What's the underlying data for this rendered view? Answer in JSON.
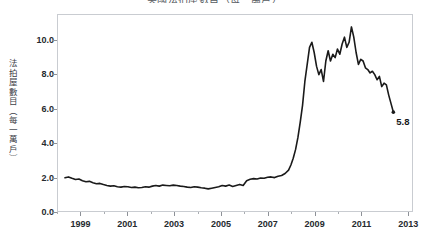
{
  "chart": {
    "title": "美國法拍屋數目（每一萬戶）",
    "ylabel": "法拍屋數目（每一萬戶）",
    "end_annotation": "5.8"
  },
  "chart_data": {
    "type": "line",
    "title": "美國法拍屋數目（每一萬戶）",
    "xlabel": "",
    "ylabel": "法拍屋數目（每一萬戶）",
    "xlim": [
      1998.0,
      2013.2
    ],
    "ylim": [
      0.0,
      11.5
    ],
    "xticks": [
      1999,
      2001,
      2003,
      2005,
      2007,
      2009,
      2011,
      2013
    ],
    "xtick_labels": [
      "1999",
      "2001",
      "2003",
      "2005",
      "2007",
      "2009",
      "2011",
      "2013"
    ],
    "yticks": [
      0.0,
      2.0,
      4.0,
      6.0,
      8.0,
      10.0
    ],
    "ytick_labels": [
      "0.0",
      "2.0",
      "4.0",
      "6.0",
      "8.0",
      "10.0"
    ],
    "grid": false,
    "legend": false,
    "line_color": "#1a1a1a",
    "line_width": 1.6,
    "annotations": [
      {
        "label": "5.8",
        "x": 2012.4,
        "y": 5.8
      }
    ],
    "series": [
      {
        "name": "法拍屋數目（每一萬戶）",
        "x": [
          1998.3,
          1998.45,
          1998.6,
          1998.75,
          1998.9,
          1999.05,
          1999.2,
          1999.35,
          1999.5,
          1999.65,
          1999.8,
          1999.95,
          2000.1,
          2000.25,
          2000.4,
          2000.55,
          2000.7,
          2000.85,
          2001.0,
          2001.15,
          2001.3,
          2001.45,
          2001.6,
          2001.75,
          2001.9,
          2002.05,
          2002.2,
          2002.35,
          2002.5,
          2002.65,
          2002.8,
          2002.95,
          2003.1,
          2003.25,
          2003.4,
          2003.55,
          2003.7,
          2003.85,
          2004.0,
          2004.15,
          2004.3,
          2004.45,
          2004.6,
          2004.75,
          2004.9,
          2005.05,
          2005.2,
          2005.35,
          2005.5,
          2005.65,
          2005.8,
          2005.95,
          2006.1,
          2006.25,
          2006.4,
          2006.55,
          2006.7,
          2006.85,
          2007.0,
          2007.15,
          2007.3,
          2007.45,
          2007.6,
          2007.75,
          2007.9,
          2008.0,
          2008.1,
          2008.2,
          2008.3,
          2008.4,
          2008.5,
          2008.6,
          2008.7,
          2008.8,
          2008.9,
          2009.0,
          2009.1,
          2009.2,
          2009.3,
          2009.4,
          2009.5,
          2009.6,
          2009.7,
          2009.8,
          2009.9,
          2010.0,
          2010.1,
          2010.2,
          2010.3,
          2010.4,
          2010.5,
          2010.6,
          2010.7,
          2010.8,
          2010.9,
          2011.0,
          2011.1,
          2011.2,
          2011.3,
          2011.4,
          2011.5,
          2011.6,
          2011.7,
          2011.8,
          2011.9,
          2012.0,
          2012.1,
          2012.2,
          2012.3,
          2012.4
        ],
        "y": [
          1.95,
          2.0,
          1.92,
          1.85,
          1.88,
          1.78,
          1.72,
          1.74,
          1.66,
          1.6,
          1.62,
          1.55,
          1.5,
          1.46,
          1.48,
          1.42,
          1.4,
          1.44,
          1.42,
          1.38,
          1.4,
          1.36,
          1.38,
          1.42,
          1.4,
          1.46,
          1.5,
          1.46,
          1.52,
          1.5,
          1.48,
          1.52,
          1.5,
          1.46,
          1.44,
          1.4,
          1.38,
          1.42,
          1.4,
          1.36,
          1.34,
          1.3,
          1.34,
          1.38,
          1.42,
          1.5,
          1.46,
          1.52,
          1.44,
          1.5,
          1.56,
          1.5,
          1.78,
          1.86,
          1.9,
          1.88,
          1.94,
          1.92,
          1.98,
          2.0,
          1.96,
          2.04,
          2.08,
          2.2,
          2.4,
          2.7,
          3.1,
          3.6,
          4.3,
          5.2,
          6.2,
          7.6,
          8.6,
          9.6,
          9.9,
          9.3,
          8.5,
          8.0,
          8.3,
          7.6,
          8.8,
          9.4,
          8.8,
          9.2,
          9.0,
          9.5,
          9.2,
          9.8,
          10.2,
          9.6,
          9.9,
          10.8,
          10.2,
          9.3,
          8.6,
          8.9,
          8.8,
          8.4,
          8.3,
          8.1,
          8.2,
          8.0,
          7.7,
          7.9,
          7.3,
          7.5,
          7.4,
          6.8,
          6.3,
          5.8
        ]
      }
    ]
  }
}
